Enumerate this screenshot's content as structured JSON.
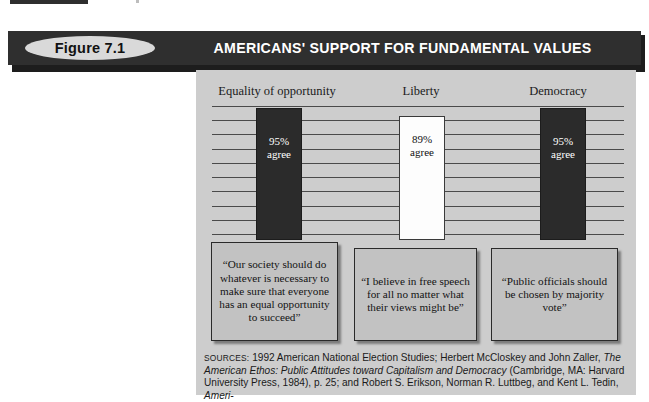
{
  "figure": {
    "pill_label": "Figure 7.1",
    "banner_title": "AMERICANS' SUPPORT FOR FUNDAMENTAL VALUES",
    "banner_color": "#2f2f2f",
    "panel_color": "#cdcdcd"
  },
  "chart_data": {
    "type": "bar",
    "title": "AMERICANS' SUPPORT FOR FUNDAMENTAL VALUES",
    "categories": [
      "Equality of opportunity",
      "Liberty",
      "Democracy"
    ],
    "values": [
      95,
      89,
      95
    ],
    "value_labels": [
      "95%",
      "89%",
      "95%"
    ],
    "value_suffix": "agree",
    "series": [
      {
        "name": "Percent agree",
        "values": [
          95,
          89,
          95
        ]
      }
    ],
    "bar_colors": [
      "#2b2b2b",
      "#fdfdfd",
      "#2b2b2b"
    ],
    "xlabel": "",
    "ylabel": "",
    "ylim": [
      0,
      100
    ],
    "grid": true,
    "gridline_count": 10,
    "legend": "none",
    "annotations": [
      "“Our society should do whatever is necessary to make sure that everyone has an equal opportunity to succeed”",
      "“I believe in free speech for all no matter what their views might be”",
      "“Public officials should be chosen by majority vote”"
    ]
  },
  "bars": [
    {
      "category": "Equality of opportunity",
      "percent_label": "95%",
      "agree_label": "agree",
      "style": "dark"
    },
    {
      "category": "Liberty",
      "percent_label": "89%",
      "agree_label": "agree",
      "style": "light"
    },
    {
      "category": "Democracy",
      "percent_label": "95%",
      "agree_label": "agree",
      "style": "dark"
    }
  ],
  "quotes": [
    {
      "text": "“Our society should do whatever is necessary to make sure that everyone has an equal opportunity to succeed”"
    },
    {
      "text": "“I believe in free speech for all no matter what their views might be”"
    },
    {
      "text": "“Public officials should be chosen by majority vote”"
    }
  ],
  "sources": {
    "label": "SOURCES:",
    "part1": " 1992 American National Election Studies; Herbert McCloskey and John Zaller, ",
    "italic1": "The American Ethos: Public Attitudes toward Capitalism and Democracy",
    "part2": " (Cambridge, MA: Harvard University Press, 1984), p. 25; and Robert S. Erikson, Norman R. Luttbeg, and Kent L. Tedin, ",
    "italic2": "Ameri-"
  }
}
